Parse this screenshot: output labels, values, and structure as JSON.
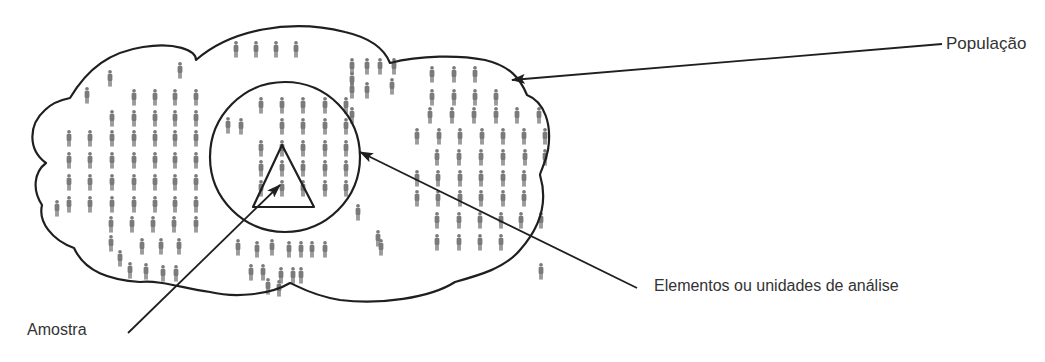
{
  "labels": {
    "population": "População",
    "elements": "Elementos ou unidades de análise",
    "sample": "Amostra"
  },
  "colors": {
    "outline": "#1f1f1f",
    "person": "#7a7a7a",
    "text": "#333333",
    "background": "#ffffff"
  },
  "shapes": {
    "cloud_path": "M70,98 C88,68 110,52 143,47 C175,42 196,50 196,60 C230,30 290,18 345,32 C380,40 388,58 390,63 C420,55 460,55 485,60 C510,66 520,78 527,95 C545,102 552,125 548,150 C545,165 540,172 540,175 C546,195 545,222 520,250 C505,268 480,275 455,282 C430,298 380,305 340,300 C310,295 296,285 290,283 C270,295 235,298 210,292 C182,288 160,280 140,282 C110,280 85,272 74,248 C52,240 38,222 42,205 C32,190 34,172 46,163 C28,150 28,125 45,110 C52,103 60,100 70,98 Z",
    "circle": {
      "cx": 285,
      "cy": 157,
      "r": 75
    },
    "triangle": "282,145 253,207 314,207"
  },
  "pointers": [
    {
      "name": "population-pointer",
      "x1": 942,
      "y1": 44,
      "x2": 512,
      "y2": 80
    },
    {
      "name": "elements-pointer",
      "x1": 637,
      "y1": 288,
      "x2": 360,
      "y2": 152
    },
    {
      "name": "sample-pointer",
      "x1": 128,
      "y1": 333,
      "x2": 280,
      "y2": 185
    }
  ],
  "people": [
    [
      236,
      49
    ],
    [
      256,
      49
    ],
    [
      276,
      49
    ],
    [
      296,
      49
    ],
    [
      180,
      70
    ],
    [
      110,
      78
    ],
    [
      87,
      95
    ],
    [
      228,
      125
    ],
    [
      134,
      97
    ],
    [
      155,
      97
    ],
    [
      175,
      97
    ],
    [
      196,
      97
    ],
    [
      112,
      118
    ],
    [
      134,
      118
    ],
    [
      155,
      118
    ],
    [
      175,
      118
    ],
    [
      196,
      118
    ],
    [
      69,
      138
    ],
    [
      90,
      138
    ],
    [
      112,
      138
    ],
    [
      134,
      138
    ],
    [
      155,
      138
    ],
    [
      175,
      138
    ],
    [
      196,
      138
    ],
    [
      69,
      160
    ],
    [
      90,
      160
    ],
    [
      112,
      160
    ],
    [
      134,
      160
    ],
    [
      155,
      160
    ],
    [
      175,
      160
    ],
    [
      196,
      160
    ],
    [
      69,
      182
    ],
    [
      90,
      182
    ],
    [
      112,
      182
    ],
    [
      134,
      182
    ],
    [
      155,
      182
    ],
    [
      175,
      182
    ],
    [
      196,
      182
    ],
    [
      69,
      204
    ],
    [
      90,
      204
    ],
    [
      112,
      204
    ],
    [
      134,
      204
    ],
    [
      155,
      204
    ],
    [
      175,
      204
    ],
    [
      196,
      204
    ],
    [
      57,
      208
    ],
    [
      111,
      224
    ],
    [
      132,
      224
    ],
    [
      153,
      224
    ],
    [
      174,
      224
    ],
    [
      196,
      224
    ],
    [
      111,
      243
    ],
    [
      142,
      246
    ],
    [
      161,
      246
    ],
    [
      179,
      246
    ],
    [
      120,
      258
    ],
    [
      130,
      270
    ],
    [
      146,
      271
    ],
    [
      163,
      273
    ],
    [
      176,
      273
    ],
    [
      261,
      105
    ],
    [
      282,
      105
    ],
    [
      303,
      105
    ],
    [
      325,
      105
    ],
    [
      346,
      105
    ],
    [
      241,
      126
    ],
    [
      282,
      126
    ],
    [
      303,
      126
    ],
    [
      325,
      126
    ],
    [
      346,
      126
    ],
    [
      261,
      148
    ],
    [
      282,
      148
    ],
    [
      303,
      148
    ],
    [
      325,
      148
    ],
    [
      346,
      148
    ],
    [
      261,
      168
    ],
    [
      282,
      168
    ],
    [
      303,
      168
    ],
    [
      325,
      168
    ],
    [
      346,
      168
    ],
    [
      261,
      188
    ],
    [
      282,
      188
    ],
    [
      303,
      188
    ],
    [
      325,
      188
    ],
    [
      346,
      188
    ],
    [
      238,
      247
    ],
    [
      257,
      249
    ],
    [
      272,
      247
    ],
    [
      289,
      249
    ],
    [
      301,
      249
    ],
    [
      312,
      249
    ],
    [
      325,
      249
    ],
    [
      251,
      272
    ],
    [
      263,
      272
    ],
    [
      281,
      275
    ],
    [
      293,
      275
    ],
    [
      301,
      275
    ],
    [
      268,
      286
    ],
    [
      279,
      288
    ],
    [
      352,
      66
    ],
    [
      367,
      66
    ],
    [
      380,
      66
    ],
    [
      394,
      66
    ],
    [
      352,
      90
    ],
    [
      367,
      90
    ],
    [
      352,
      80
    ],
    [
      352,
      115
    ],
    [
      430,
      115
    ],
    [
      452,
      115
    ],
    [
      474,
      115
    ],
    [
      496,
      115
    ],
    [
      517,
      115
    ],
    [
      539,
      115
    ],
    [
      392,
      86
    ],
    [
      432,
      74
    ],
    [
      454,
      74
    ],
    [
      475,
      74
    ],
    [
      432,
      97
    ],
    [
      454,
      97
    ],
    [
      475,
      97
    ],
    [
      496,
      97
    ],
    [
      417,
      136
    ],
    [
      439,
      136
    ],
    [
      460,
      136
    ],
    [
      482,
      136
    ],
    [
      503,
      136
    ],
    [
      524,
      136
    ],
    [
      545,
      136
    ],
    [
      437,
      157
    ],
    [
      459,
      157
    ],
    [
      481,
      157
    ],
    [
      503,
      157
    ],
    [
      525,
      157
    ],
    [
      545,
      157
    ],
    [
      417,
      178
    ],
    [
      438,
      178
    ],
    [
      460,
      178
    ],
    [
      481,
      178
    ],
    [
      503,
      178
    ],
    [
      524,
      178
    ],
    [
      417,
      198
    ],
    [
      438,
      198
    ],
    [
      460,
      198
    ],
    [
      481,
      198
    ],
    [
      503,
      198
    ],
    [
      524,
      198
    ],
    [
      437,
      220
    ],
    [
      459,
      220
    ],
    [
      480,
      220
    ],
    [
      501,
      220
    ],
    [
      521,
      220
    ],
    [
      541,
      220
    ],
    [
      437,
      242
    ],
    [
      459,
      242
    ],
    [
      480,
      242
    ],
    [
      501,
      242
    ],
    [
      358,
      212
    ],
    [
      378,
      238
    ],
    [
      381,
      247
    ],
    [
      541,
      271
    ]
  ]
}
